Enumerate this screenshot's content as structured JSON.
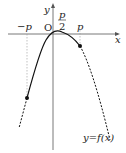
{
  "diagram": {
    "axes": {
      "x_label": "x",
      "y_label": "y",
      "origin_label": "O"
    },
    "ticks": {
      "neg_p": "−p",
      "half_p_num": "p",
      "half_p_den": "2",
      "p": "p"
    },
    "curve_label": "y=f(x)",
    "colors": {
      "curve": "#111111",
      "axes": "#555555",
      "guides": "#999999"
    }
  }
}
